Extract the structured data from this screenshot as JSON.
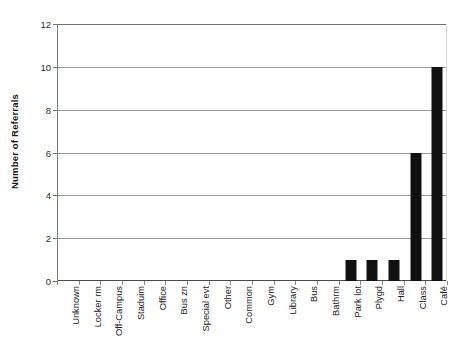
{
  "chart_data": {
    "type": "bar",
    "title": "",
    "subtitle": "",
    "xlabel": "",
    "ylabel": "Number of Referrals",
    "ylim": [
      0,
      12
    ],
    "ytick_values": [
      0,
      2,
      4,
      6,
      8,
      10,
      12
    ],
    "ytick_labels": [
      "0",
      "2",
      "4",
      "6",
      "8",
      "10",
      "12"
    ],
    "yminor_values": [
      1,
      3,
      5,
      7,
      9,
      11
    ],
    "grid": "horizontal",
    "legend": "none",
    "bar_color": "#111111",
    "grid_color": "#9a9a9a",
    "categories": [
      "Unknown",
      "Locker rm",
      "Off-Campus",
      "Staduim",
      "Office",
      "Bus zn",
      "Special evt",
      "Other",
      "Common",
      "Gym",
      "Library",
      "Bus",
      "Bathrm",
      "Park lot",
      "Plygd",
      "Hall",
      "Class",
      "Café"
    ],
    "values": [
      0,
      0,
      0,
      0,
      0,
      0,
      0,
      0,
      0,
      0,
      0,
      0,
      0,
      1,
      1,
      1,
      6,
      10
    ]
  }
}
